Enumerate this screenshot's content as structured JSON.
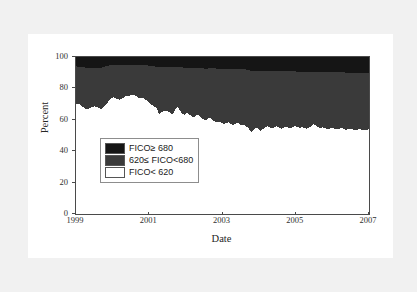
{
  "figure": {
    "background_color": "#f1f1f1",
    "panel_color": "#ffffff",
    "caption_partial": ""
  },
  "chart_data": {
    "type": "area",
    "stacked": true,
    "title": "",
    "xlabel": "Date",
    "ylabel": "Percent",
    "ylim": [
      0,
      100
    ],
    "xlim": [
      1999.0,
      2007.0
    ],
    "grid": false,
    "legend_position": "lower-left-inside",
    "ytick_labels": [
      "0",
      "20",
      "40",
      "60",
      "80",
      "100"
    ],
    "ytick_values": [
      0,
      20,
      40,
      60,
      80,
      100
    ],
    "xtick_labels": [
      "1999",
      "2001",
      "2003",
      "2005",
      "2007"
    ],
    "xtick_values": [
      1999,
      2001,
      2003,
      2005,
      2007
    ],
    "colors": {
      "FICO>=680": "#151515",
      "620<=FICO<680": "#3a3a3a",
      "FICO<620": "#ffffff"
    },
    "series": [
      {
        "name": "FICO< 620",
        "color": "#ffffff",
        "values": [
          70.0,
          70.2,
          69.5,
          68.2,
          67.0,
          66.8,
          67.5,
          68.0,
          68.6,
          68.2,
          67.4,
          67.0,
          68.0,
          69.5,
          71.5,
          73.6,
          74.3,
          74.0,
          73.2,
          72.8,
          73.5,
          74.6,
          75.4,
          75.2,
          75.8,
          76.0,
          75.2,
          74.0,
          73.6,
          73.8,
          73.0,
          71.8,
          70.6,
          69.4,
          68.2,
          67.4,
          63.8,
          64.6,
          65.5,
          66.0,
          65.4,
          64.2,
          63.5,
          66.8,
          68.2,
          66.2,
          64.0,
          63.0,
          64.4,
          63.6,
          62.4,
          61.6,
          62.8,
          63.4,
          62.0,
          60.6,
          59.4,
          60.6,
          61.4,
          60.2,
          59.0,
          58.4,
          59.0,
          58.2,
          57.4,
          57.8,
          58.4,
          57.6,
          56.8,
          57.4,
          58.0,
          57.2,
          56.4,
          56.8,
          55.6,
          54.2,
          52.0,
          53.4,
          55.0,
          54.2,
          53.0,
          54.0,
          55.4,
          55.8,
          55.0,
          54.4,
          55.2,
          55.8,
          55.0,
          54.4,
          55.0,
          55.6,
          55.0,
          54.6,
          55.4,
          56.0,
          55.4,
          54.8,
          55.2,
          55.0,
          54.2,
          55.0,
          55.6,
          57.2,
          56.4,
          55.2,
          54.6,
          55.2,
          54.6,
          54.0,
          54.4,
          55.0,
          54.4,
          53.8,
          54.2,
          54.8,
          54.2,
          53.6,
          54.0,
          54.4,
          53.8,
          53.4,
          53.8,
          54.2,
          53.6,
          53.2,
          53.6,
          54.0
        ]
      },
      {
        "name": "620≤ FICO<680",
        "color": "#3a3a3a",
        "values": [
          24.0,
          23.6,
          24.2,
          25.4,
          26.2,
          26.0,
          25.2,
          24.8,
          24.4,
          24.8,
          25.6,
          26.2,
          25.6,
          24.6,
          23.0,
          21.4,
          20.8,
          21.2,
          21.8,
          22.2,
          21.6,
          20.6,
          19.8,
          20.0,
          19.4,
          19.2,
          20.0,
          21.0,
          21.4,
          21.2,
          21.8,
          22.8,
          23.8,
          24.8,
          25.8,
          26.4,
          29.6,
          28.8,
          28.0,
          27.6,
          28.2,
          29.2,
          29.8,
          26.8,
          25.6,
          27.4,
          29.4,
          30.2,
          28.8,
          29.6,
          30.6,
          31.4,
          30.2,
          29.6,
          31.0,
          32.2,
          33.2,
          32.0,
          31.4,
          32.6,
          33.8,
          34.2,
          33.6,
          34.4,
          35.0,
          34.6,
          34.0,
          34.8,
          35.4,
          34.8,
          34.2,
          35.0,
          35.8,
          35.4,
          36.4,
          37.6,
          39.0,
          37.8,
          36.4,
          37.2,
          38.2,
          37.2,
          36.0,
          35.6,
          36.2,
          36.8,
          36.0,
          35.4,
          36.0,
          36.6,
          36.0,
          35.4,
          35.8,
          36.2,
          35.4,
          34.8,
          35.2,
          35.8,
          35.4,
          35.6,
          36.2,
          35.4,
          34.8,
          33.4,
          34.2,
          35.2,
          35.8,
          35.2,
          35.8,
          36.2,
          35.8,
          35.2,
          35.8,
          36.4,
          36.0,
          35.4,
          36.0,
          36.4,
          36.0,
          35.6,
          36.2,
          36.6,
          36.2,
          35.8,
          36.4,
          36.8,
          36.4,
          36.0
        ]
      },
      {
        "name": "FICO≥ 680",
        "color": "#151515",
        "values": [
          6.0,
          6.2,
          6.3,
          6.4,
          6.8,
          7.2,
          7.3,
          7.2,
          7.0,
          7.0,
          7.0,
          6.8,
          6.4,
          5.9,
          5.5,
          5.0,
          4.9,
          4.8,
          5.0,
          5.0,
          4.9,
          4.8,
          4.8,
          4.8,
          4.8,
          4.8,
          4.8,
          5.0,
          5.0,
          5.0,
          5.2,
          5.4,
          5.6,
          5.8,
          6.0,
          6.2,
          6.6,
          6.6,
          6.5,
          6.4,
          6.4,
          6.6,
          6.7,
          6.4,
          6.2,
          6.4,
          6.6,
          6.8,
          6.8,
          6.8,
          7.0,
          7.0,
          7.0,
          7.0,
          7.0,
          7.2,
          7.4,
          7.4,
          7.2,
          7.2,
          7.2,
          7.4,
          7.4,
          7.4,
          7.6,
          7.6,
          7.6,
          7.6,
          7.8,
          7.8,
          7.8,
          7.8,
          7.8,
          7.8,
          8.0,
          8.2,
          9.0,
          8.8,
          8.6,
          8.6,
          8.8,
          8.8,
          8.6,
          8.6,
          8.8,
          8.8,
          8.8,
          8.8,
          9.0,
          9.0,
          9.0,
          9.0,
          9.2,
          9.2,
          9.2,
          9.2,
          9.4,
          9.4,
          9.4,
          9.4,
          9.6,
          9.6,
          9.6,
          9.4,
          9.4,
          9.6,
          9.6,
          9.6,
          9.6,
          9.8,
          9.8,
          9.8,
          9.8,
          9.8,
          9.8,
          9.8,
          9.8,
          10.0,
          10.0,
          10.0,
          10.0,
          10.0,
          10.0,
          10.0,
          10.0,
          10.0,
          10.0,
          10.0
        ]
      }
    ]
  },
  "legend": {
    "items": [
      {
        "label": "FICO≥ 680",
        "color": "#151515"
      },
      {
        "label": "620≤ FICO<680",
        "color": "#3a3a3a"
      },
      {
        "label": "FICO< 620",
        "color": "#ffffff"
      }
    ]
  },
  "axes": {
    "y_title": "Percent",
    "x_title": "Date"
  }
}
